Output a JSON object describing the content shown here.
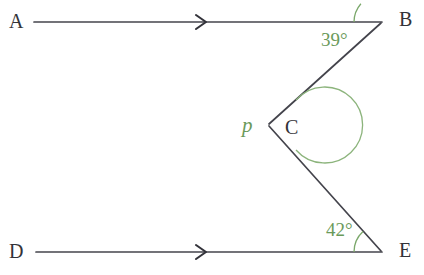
{
  "diagram": {
    "type": "geometry-angle-diagram",
    "background_color": "#ffffff",
    "line_color": "#44444c",
    "annotation_color": "#6a9a5a",
    "label_color": "#333338",
    "points": {
      "A": {
        "label": "A",
        "x": 22,
        "y": 22
      },
      "B": {
        "label": "B",
        "x": 382,
        "y": 22
      },
      "C": {
        "label": "C",
        "x": 268,
        "y": 125
      },
      "D": {
        "label": "D",
        "x": 22,
        "y": 252
      },
      "E": {
        "label": "E",
        "x": 382,
        "y": 252
      }
    },
    "lines": [
      {
        "name": "line-AB",
        "from": "A",
        "to": "B",
        "arrow": true,
        "arrow_x": 203,
        "y": 22
      },
      {
        "name": "line-DE",
        "from": "D",
        "to": "E",
        "arrow": true,
        "arrow_x": 203,
        "y": 252
      },
      {
        "name": "segment-BC",
        "from": "B",
        "to": "C",
        "arrow": false
      },
      {
        "name": "segment-CE",
        "from": "C",
        "to": "E",
        "arrow": false
      }
    ],
    "angles": [
      {
        "name": "angle-at-B",
        "vertex": "B",
        "value": "39°",
        "measure": 39,
        "unit": "degrees",
        "arc_radius": 28,
        "reflex": false
      },
      {
        "name": "angle-at-E",
        "vertex": "E",
        "value": "42°",
        "measure": 42,
        "unit": "degrees",
        "arc_radius": 28,
        "reflex": false
      },
      {
        "name": "angle-at-C",
        "vertex": "C",
        "value": "p",
        "measure": null,
        "unit": "variable",
        "arc_radius": 38,
        "reflex": true
      }
    ]
  }
}
